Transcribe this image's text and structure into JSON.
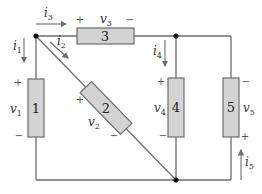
{
  "diagram": {
    "type": "circuit",
    "colors": {
      "wire": "#6e6e6e",
      "element_fill": "#d3d3d3",
      "node": "#111111"
    },
    "elements": [
      {
        "id": "1",
        "label": "1",
        "voltage": "v",
        "voltage_sub": "1",
        "plus": "+",
        "minus": "−"
      },
      {
        "id": "2",
        "label": "2",
        "voltage": "v",
        "voltage_sub": "2",
        "plus": "+",
        "minus": "−"
      },
      {
        "id": "3",
        "label": "3",
        "voltage": "v",
        "voltage_sub": "3",
        "plus": "+",
        "minus": "−"
      },
      {
        "id": "4",
        "label": "4",
        "voltage": "v",
        "voltage_sub": "4",
        "plus": "+",
        "minus": "−"
      },
      {
        "id": "5",
        "label": "5",
        "voltage": "v",
        "voltage_sub": "5",
        "plus": "+",
        "minus": "−"
      }
    ],
    "currents": [
      {
        "id": "i1",
        "name": "i",
        "sub": "1",
        "direction": "down"
      },
      {
        "id": "i2",
        "name": "i",
        "sub": "2",
        "direction": "diagonal-down-right"
      },
      {
        "id": "i3",
        "name": "i",
        "sub": "3",
        "direction": "right"
      },
      {
        "id": "i4",
        "name": "i",
        "sub": "4",
        "direction": "down"
      },
      {
        "id": "i5",
        "name": "i",
        "sub": "5",
        "direction": "up"
      }
    ]
  }
}
